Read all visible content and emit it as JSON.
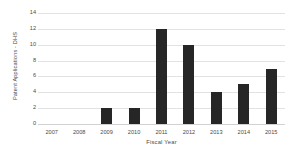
{
  "chart_data": {
    "type": "bar",
    "title": "",
    "xlabel": "Fiscal Year",
    "ylabel": "Patent Applications - DHS",
    "categories": [
      "2007",
      "2008",
      "2009",
      "2010",
      "2011",
      "2012",
      "2013",
      "2014",
      "2015"
    ],
    "values": [
      0,
      0,
      2,
      2,
      12,
      10,
      4,
      5,
      7
    ],
    "ylim": [
      0,
      14
    ],
    "yticks": [
      0,
      2,
      4,
      6,
      8,
      10,
      12,
      14
    ],
    "ytick_labels": [
      "0",
      "2",
      "4",
      "6",
      "8",
      "10",
      "12",
      "14"
    ],
    "grid": "horizontal",
    "legend": "none",
    "colors": {
      "bar": "#262626",
      "gridline": "#e2e2e2",
      "baseline": "#d2d2d2",
      "text": "#4a4a4a",
      "background": "#ffffff"
    }
  }
}
